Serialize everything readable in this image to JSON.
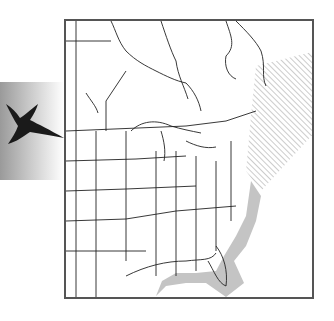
{
  "figure": {
    "type": "range-map",
    "region": "Eastern North America",
    "legend_icon": "bird-silhouette-icon",
    "colors": {
      "frame": "#555555",
      "state_lines": "#222222",
      "range_shading": "#b5b5b5",
      "hatch": "#9a9a9a",
      "bird": "#1a1a1a"
    },
    "range_features": [
      {
        "name": "coastal-winter-range",
        "style": "gray shading along Atlantic and Gulf coasts"
      },
      {
        "name": "northeast-hatched-range",
        "style": "diagonal hatching over Maritime provinces and Newfoundland"
      }
    ]
  }
}
